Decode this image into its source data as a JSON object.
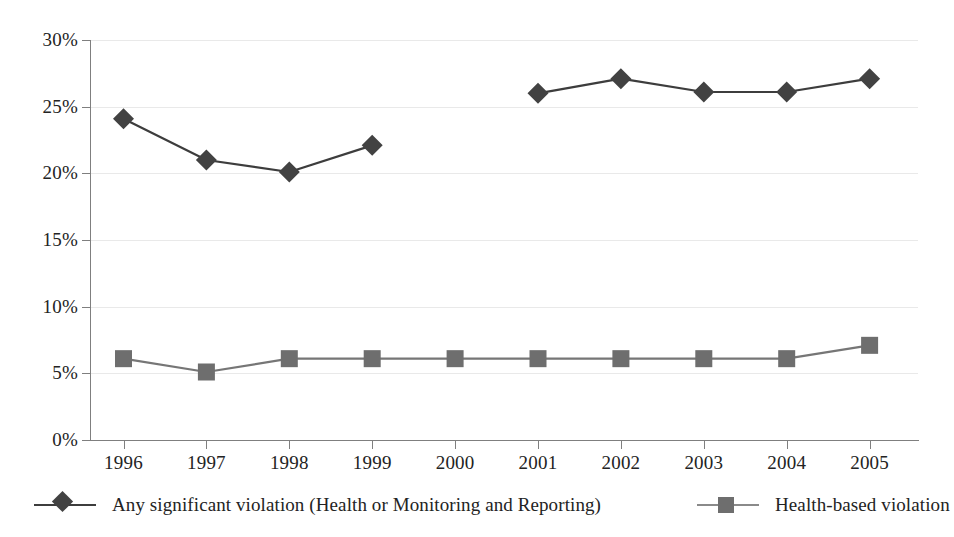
{
  "chart_data": {
    "type": "line",
    "title": "",
    "subtitle": "",
    "xlabel": "",
    "ylabel": "",
    "categories": [
      "1996",
      "1997",
      "1998",
      "1999",
      "2000",
      "2001",
      "2002",
      "2003",
      "2004",
      "2005"
    ],
    "ylim": [
      0,
      30
    ],
    "y_ticks": [
      0,
      5,
      10,
      15,
      20,
      25,
      30
    ],
    "y_tick_labels": [
      "0%",
      "5%",
      "10%",
      "15%",
      "20%",
      "25%",
      "30%"
    ],
    "grid": true,
    "grid_axis": "y",
    "legend_position": "bottom",
    "series": [
      {
        "name": "Any significant violation (Health or Monitoring and Reporting)",
        "marker": "diamond",
        "color": "#424242",
        "line_color": "#3d3d3d",
        "values": [
          24.1,
          21.0,
          20.1,
          22.1,
          null,
          26.0,
          27.1,
          26.1,
          26.1,
          27.1
        ]
      },
      {
        "name": "Health-based violation",
        "marker": "square",
        "color": "#6e6e6e",
        "line_color": "#767676",
        "values": [
          6.1,
          5.1,
          6.1,
          6.1,
          6.1,
          6.1,
          6.1,
          6.1,
          6.1,
          7.1
        ]
      }
    ]
  },
  "axis": {
    "y_labels": [
      "30%",
      "25%",
      "20%",
      "15%",
      "10%",
      "5%",
      "0%"
    ],
    "x_labels": [
      "1996",
      "1997",
      "1998",
      "1999",
      "2000",
      "2001",
      "2002",
      "2003",
      "2004",
      "2005"
    ]
  },
  "legend": {
    "items": [
      {
        "label": "Any significant violation (Health or Monitoring and Reporting)",
        "marker": "diamond-marker",
        "color": "#424242"
      },
      {
        "label": "Health-based violation",
        "marker": "square-marker",
        "color": "#6e6e6e"
      }
    ]
  },
  "colors": {
    "series_primary": "#424242",
    "series_secondary": "#6e6e6e",
    "gridline": "#e9e9e9",
    "axis": "#7f7f7f",
    "text": "#232323",
    "background": "#ffffff"
  }
}
